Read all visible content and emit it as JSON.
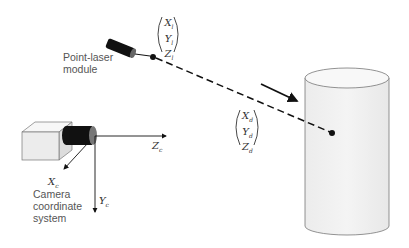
{
  "labels": {
    "laser_module": [
      "Point-laser",
      "module"
    ],
    "camera_system": [
      "Camera",
      "coordinate",
      "system"
    ]
  },
  "vectors": {
    "laser_point": {
      "x": "X",
      "y": "Y",
      "z": "Z",
      "sub": "l"
    },
    "direction": {
      "x": "X",
      "y": "Y",
      "z": "Z",
      "sub": "d"
    }
  },
  "axes": {
    "zc": {
      "name": "Z",
      "sub": "c"
    },
    "xc": {
      "name": "X",
      "sub": "c"
    },
    "yc": {
      "name": "Y",
      "sub": "c"
    }
  },
  "colors": {
    "line": "#111111",
    "cylinder_fill": "#f2f2f2",
    "box_fill": "#eeeeee",
    "text": "#555555"
  }
}
